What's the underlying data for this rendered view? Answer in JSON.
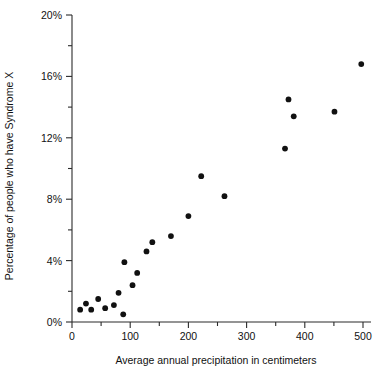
{
  "chart_data": {
    "type": "scatter",
    "title": "",
    "xlabel": "Average annual precipitation in centimeters",
    "ylabel": "Percentage of people who have Syndrome X",
    "xlim": [
      0,
      500
    ],
    "ylim": [
      0,
      20
    ],
    "grid": false,
    "legend": null,
    "x_ticks": [
      0,
      100,
      200,
      300,
      400,
      500
    ],
    "x_tick_labels": [
      "0",
      "100",
      "200",
      "300",
      "400",
      "500"
    ],
    "x_minor_ticks": [
      50,
      150,
      250,
      350,
      450
    ],
    "y_ticks": [
      0,
      4,
      8,
      12,
      16,
      20
    ],
    "y_tick_labels": [
      "0%",
      "4%",
      "8%",
      "12%",
      "16%",
      "20%"
    ],
    "y_minor_ticks": [
      2,
      6,
      10,
      14,
      18
    ],
    "y_unit": "%",
    "marker": "filled-circle",
    "marker_color": "#111111",
    "points": [
      {
        "x": 14,
        "y": 0.8
      },
      {
        "x": 24,
        "y": 1.2
      },
      {
        "x": 33,
        "y": 0.8
      },
      {
        "x": 45,
        "y": 1.5
      },
      {
        "x": 57,
        "y": 0.9
      },
      {
        "x": 72,
        "y": 1.1
      },
      {
        "x": 80,
        "y": 1.9
      },
      {
        "x": 88,
        "y": 0.5
      },
      {
        "x": 90,
        "y": 3.9
      },
      {
        "x": 104,
        "y": 2.4
      },
      {
        "x": 112,
        "y": 3.2
      },
      {
        "x": 128,
        "y": 4.6
      },
      {
        "x": 138,
        "y": 5.2
      },
      {
        "x": 170,
        "y": 5.6
      },
      {
        "x": 200,
        "y": 6.9
      },
      {
        "x": 222,
        "y": 9.5
      },
      {
        "x": 262,
        "y": 8.2
      },
      {
        "x": 366,
        "y": 11.3
      },
      {
        "x": 372,
        "y": 14.5
      },
      {
        "x": 381,
        "y": 13.4
      },
      {
        "x": 451,
        "y": 13.7
      },
      {
        "x": 497,
        "y": 16.8
      }
    ]
  }
}
